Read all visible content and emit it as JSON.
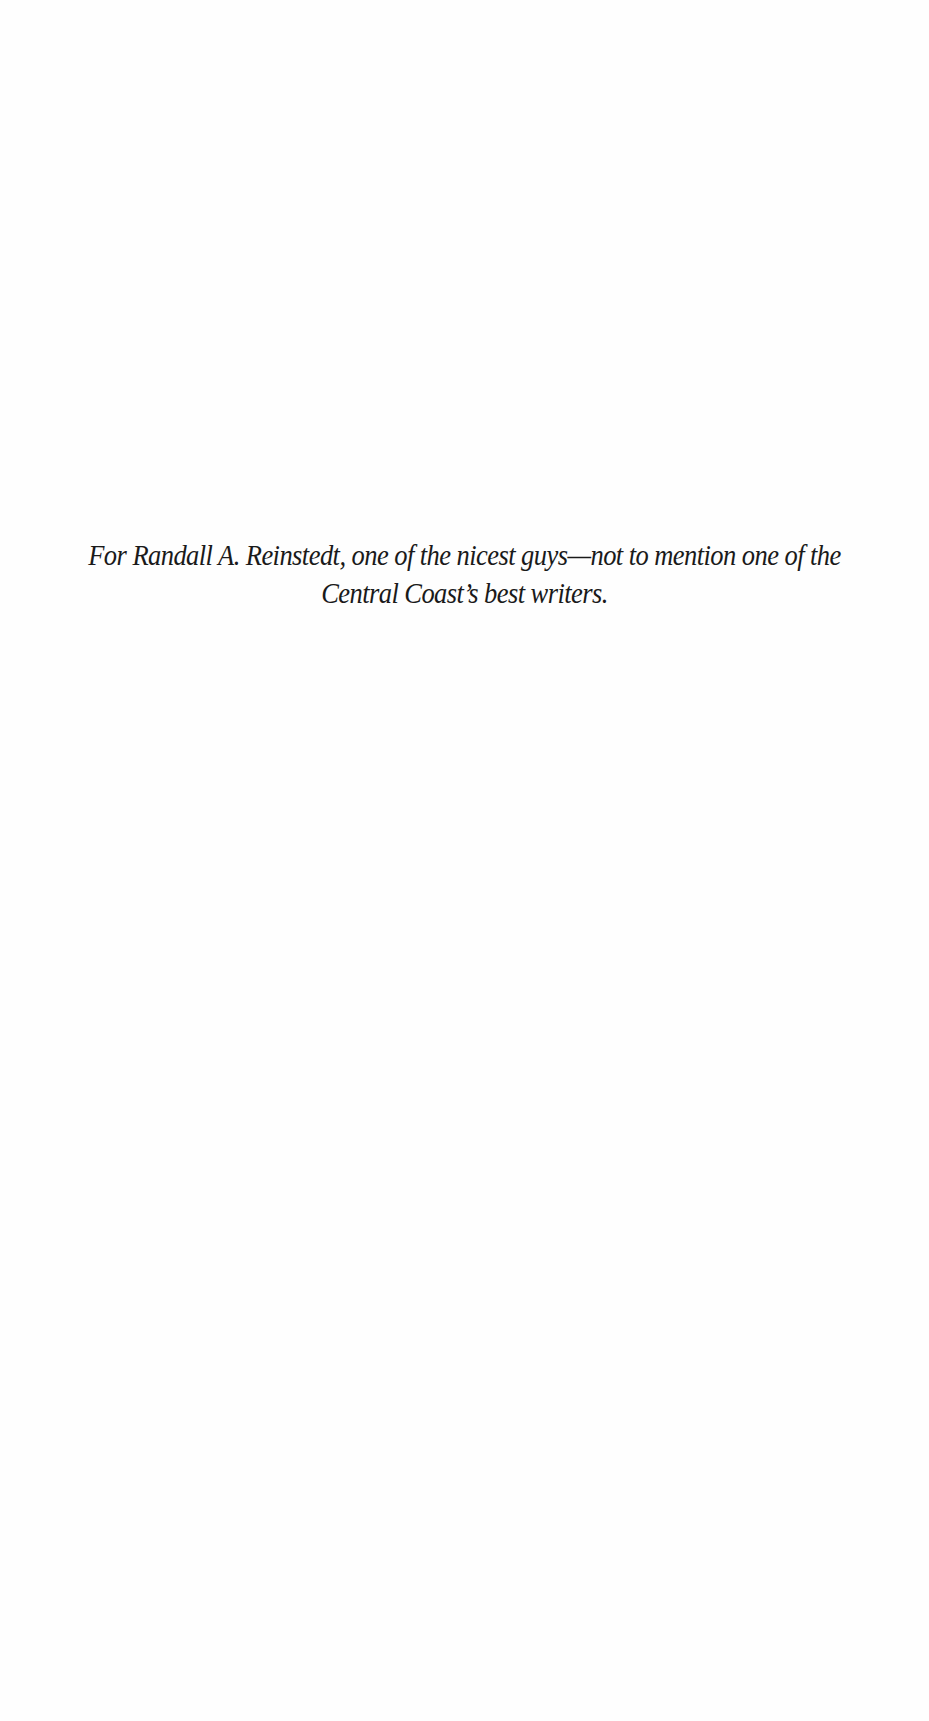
{
  "page": {
    "type": "dedication",
    "dedication_text": "For Randall A. Reinstedt, one of the nicest guys—not to mention one of the Central Coast’s best writers."
  }
}
